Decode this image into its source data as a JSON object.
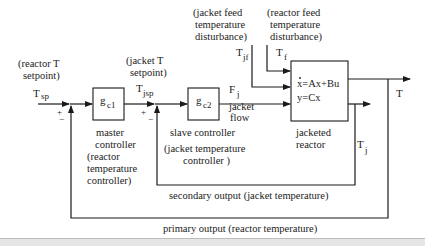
{
  "diagram": {
    "type": "cascade control block diagram",
    "inputs": {
      "reactor_setpoint": {
        "desc_line1": "(reactor T",
        "desc_line2": "setpoint)",
        "symbol": "T",
        "sub": "sp"
      },
      "jacket_setpoint": {
        "desc_line1": "(jacket T",
        "desc_line2": "setpoint)",
        "symbol": "T",
        "sub": "jsp"
      },
      "jacket_feed_disturbance": {
        "line1": "(jacket feed",
        "line2": "temperature",
        "line3": "disturbance)",
        "symbol": "T",
        "sub": "jf"
      },
      "reactor_feed_disturbance": {
        "line1": "(reactor feed",
        "line2": "temperature",
        "line3": "disturbance)",
        "symbol": "T",
        "sub": "f"
      }
    },
    "blocks": {
      "master": {
        "symbol": "g",
        "sub": "c1",
        "label1": "master",
        "label2": "controller",
        "label3": "(reactor",
        "label4": "temperature",
        "label5": "controller)"
      },
      "slave": {
        "symbol": "g",
        "sub": "c2",
        "label1": "slave controller",
        "label2": "(jacket temperature",
        "label3": "controller )"
      },
      "reactor": {
        "eq1": "x=Ax+Bu",
        "eq2": "y=Cx",
        "label1": "jacketed",
        "label2": "reactor"
      }
    },
    "signals": {
      "jacket_flow": {
        "symbol": "F",
        "sub": "j",
        "label1": "jacket",
        "label2": "flow"
      },
      "output_T": {
        "symbol": "T"
      },
      "output_Tj": {
        "symbol": "T",
        "sub": "j"
      },
      "sum1": {
        "plus": "+",
        "minus": "−"
      },
      "sum2": {
        "plus": "+",
        "minus": "−"
      }
    },
    "feedback": {
      "secondary": "secondary output (jacket temperature)",
      "primary": "primary output (reactor temperature)"
    },
    "colors": {
      "line": "#1a1a1a",
      "text": "#222222",
      "background": "#ffffff"
    }
  }
}
